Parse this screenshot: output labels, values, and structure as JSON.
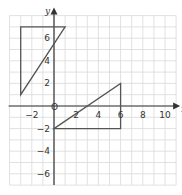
{
  "chart_data": {
    "type": "coordinate-grid",
    "xlabel": "x",
    "ylabel": "y",
    "xlim": [
      -4,
      11
    ],
    "ylim": [
      -7,
      8
    ],
    "grid": true,
    "origin_label": "O",
    "x_ticks": [
      {
        "value": -2,
        "label": "−2"
      },
      {
        "value": 2,
        "label": "2"
      },
      {
        "value": 4,
        "label": "4"
      },
      {
        "value": 6,
        "label": "6"
      },
      {
        "value": 8,
        "label": "8"
      },
      {
        "value": 10,
        "label": "10"
      }
    ],
    "y_ticks": [
      {
        "value": 6,
        "label": "6"
      },
      {
        "value": 4,
        "label": "4"
      },
      {
        "value": 2,
        "label": "2"
      },
      {
        "value": -2,
        "label": "−2"
      },
      {
        "value": -4,
        "label": "−4"
      },
      {
        "value": -6,
        "label": "−6"
      }
    ],
    "shapes": [
      {
        "name": "triangle-A",
        "type": "triangle",
        "vertices": [
          [
            -3,
            7
          ],
          [
            1,
            7
          ],
          [
            -3,
            1
          ]
        ]
      },
      {
        "name": "triangle-B",
        "type": "triangle",
        "vertices": [
          [
            0,
            -2
          ],
          [
            6,
            2
          ],
          [
            6,
            -2
          ]
        ]
      }
    ]
  },
  "colors": {
    "grid": "#d9d9d9",
    "axis": "#333333",
    "shape": "#555555"
  }
}
